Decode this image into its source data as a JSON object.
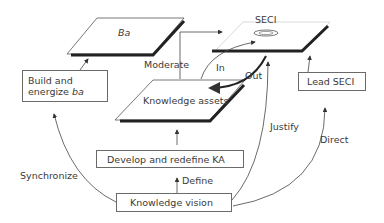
{
  "diagram": {
    "planes": {
      "ba": "Ba",
      "seci": "SECI",
      "knowledge_assets": "Knowledge assets"
    },
    "boxes": {
      "build_energize_line1": "Build and",
      "build_energize_line2_prefix": "energize ",
      "build_energize_line2_italic": "ba",
      "lead_seci": "Lead SECI",
      "develop_redefine": "Develop and redefine KA",
      "knowledge_vision": "Knowledge vision"
    },
    "edge_labels": {
      "moderate": "Moderate",
      "in": "In",
      "out": "Out",
      "justify": "Justify",
      "direct": "Direct",
      "define": "Define",
      "synchronize": "Synchronize"
    }
  }
}
